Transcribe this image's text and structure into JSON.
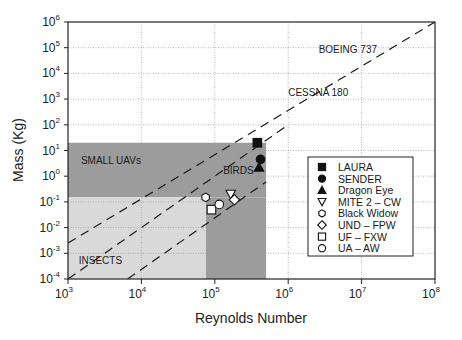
{
  "chart_data": {
    "type": "scatter",
    "title": "",
    "xlabel": "Reynolds Number",
    "ylabel": "Mass (Kg)",
    "xscale": "log",
    "yscale": "log",
    "xlim": [
      1000,
      100000000
    ],
    "ylim": [
      0.0001,
      1000000
    ],
    "grid": true,
    "legend_position": "lower right (inside)",
    "x_ticks": [
      {
        "base": "10",
        "exp": "3",
        "value": 1000
      },
      {
        "base": "10",
        "exp": "4",
        "value": 10000
      },
      {
        "base": "10",
        "exp": "5",
        "value": 100000
      },
      {
        "base": "10",
        "exp": "6",
        "value": 1000000
      },
      {
        "base": "10",
        "exp": "7",
        "value": 10000000
      },
      {
        "base": "10",
        "exp": "8",
        "value": 100000000
      }
    ],
    "y_ticks": [
      {
        "base": "10",
        "exp": "-4",
        "value": 0.0001
      },
      {
        "base": "10",
        "exp": "-3",
        "value": 0.001
      },
      {
        "base": "10",
        "exp": "-2",
        "value": 0.01
      },
      {
        "base": "10",
        "exp": "-1",
        "value": 0.1
      },
      {
        "base": "10",
        "exp": "0",
        "value": 1
      },
      {
        "base": "10",
        "exp": "1",
        "value": 10
      },
      {
        "base": "10",
        "exp": "2",
        "value": 100
      },
      {
        "base": "10",
        "exp": "3",
        "value": 1000
      },
      {
        "base": "10",
        "exp": "4",
        "value": 10000
      },
      {
        "base": "10",
        "exp": "5",
        "value": 100000
      },
      {
        "base": "10",
        "exp": "6",
        "value": 1000000
      }
    ],
    "regions": [
      {
        "name": "SMALL UAVs / BIRDS",
        "x_range": [
          1000,
          500000
        ],
        "y_range": [
          0.15,
          20
        ],
        "color": "#9c9c9c"
      },
      {
        "name": "BIRDS (lower band)",
        "x_range": [
          75000,
          500000
        ],
        "y_range": [
          0.0001,
          0.15
        ],
        "color": "#9c9c9c"
      },
      {
        "name": "INSECTS",
        "x_range": [
          1000,
          75000
        ],
        "y_range": [
          0.0001,
          0.15
        ],
        "color": "#d9d9d9"
      }
    ],
    "region_labels": [
      {
        "text": "SMALL UAVs",
        "x": 1500,
        "y": 3
      },
      {
        "text": "BIRDS",
        "x": 130000,
        "y": 1.2
      },
      {
        "text": "INSECTS",
        "x": 1400,
        "y": 0.0004
      }
    ],
    "trend_lines": [
      {
        "style": "dashed",
        "points": [
          [
            1000,
            0.0025
          ],
          [
            100000000,
            1000000
          ]
        ]
      },
      {
        "style": "dashed",
        "points": [
          [
            1000,
            0.0001
          ],
          [
            1000000,
            100
          ]
        ]
      },
      {
        "style": "dashed",
        "points": [
          [
            6500,
            0.0001
          ],
          [
            500000,
            0.6
          ]
        ]
      }
    ],
    "annotations": [
      {
        "text": "BOEING 737",
        "x": 2600000,
        "y": 60000
      },
      {
        "text": "CESSNA 180",
        "x": 1000000,
        "y": 1300
      }
    ],
    "series": [
      {
        "name": "LAURA",
        "marker": "square",
        "filled": true,
        "x": [
          380000
        ],
        "y": [
          20
        ]
      },
      {
        "name": "SENDER",
        "marker": "circle",
        "filled": true,
        "x": [
          420000
        ],
        "y": [
          4.5
        ]
      },
      {
        "name": "Dragon Eye",
        "marker": "triangle-up",
        "filled": true,
        "x": [
          400000
        ],
        "y": [
          2.2
        ]
      },
      {
        "name": "MITE 2 – CW",
        "marker": "triangle-down",
        "filled": false,
        "x": [
          165000
        ],
        "y": [
          0.2
        ]
      },
      {
        "name": "Black Widow",
        "marker": "hexagon",
        "filled": false,
        "x": [
          75000
        ],
        "y": [
          0.15
        ]
      },
      {
        "name": "UND – FPW",
        "marker": "diamond",
        "filled": false,
        "x": [
          185000
        ],
        "y": [
          0.12
        ]
      },
      {
        "name": "UF – FXW",
        "marker": "square",
        "filled": false,
        "x": [
          90000
        ],
        "y": [
          0.05
        ]
      },
      {
        "name": "UA – AW",
        "marker": "circle",
        "filled": false,
        "x": [
          115000
        ],
        "y": [
          0.08
        ]
      }
    ]
  }
}
